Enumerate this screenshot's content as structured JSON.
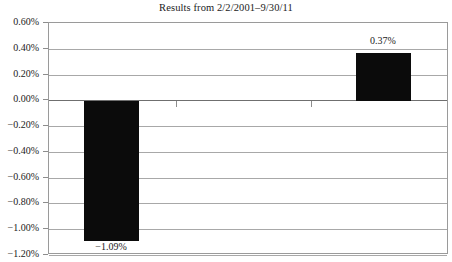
{
  "chart_data": {
    "type": "bar",
    "title": "Results from 2/2/2001–9/30/11",
    "xlabel": "",
    "ylabel": "",
    "categories": [
      "",
      "",
      ""
    ],
    "values": [
      -1.09,
      null,
      0.37
    ],
    "data_labels": [
      "−1.09%",
      "",
      "0.37%"
    ],
    "ylim": [
      -1.2,
      0.6
    ],
    "ytick_step": 0.2,
    "ytick_labels": [
      "0.60%",
      "0.40%",
      "0.20%",
      "0.00%",
      "−0.20%",
      "−0.40%",
      "−0.60%",
      "−0.80%",
      "−1.00%",
      "−1.20%"
    ],
    "ytick_values": [
      0.6,
      0.4,
      0.2,
      0.0,
      -0.2,
      -0.4,
      -0.6,
      -0.8,
      -1.0,
      -1.2
    ],
    "grid": true,
    "legend": false,
    "bar_color": "#0b0b0b",
    "plot_border_color": "#9a9a9a",
    "gridline_color": "#a8a8a8",
    "zero_line_color": "#6f6f6f",
    "series": [
      {
        "name": "Results",
        "values": [
          -1.09,
          null,
          0.37
        ]
      }
    ]
  },
  "labels": {
    "negative_bar": "−1.09%",
    "positive_bar": "0.37%"
  }
}
